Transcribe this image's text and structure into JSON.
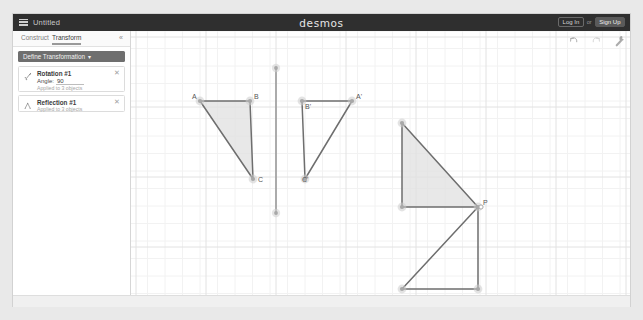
{
  "window": {
    "title": "Untitled",
    "brand": "desmos",
    "menu_icon": "hamburger-menu-icon"
  },
  "account": {
    "login_label": "Log In",
    "separator": "or",
    "signup_label": "Sign Up"
  },
  "panel": {
    "tabs": [
      {
        "label": "Construct",
        "active": false
      },
      {
        "label": "Transform",
        "active": true
      }
    ],
    "collapse_icon": "«",
    "define_button": {
      "label": "Define Transformation",
      "caret": "▾"
    },
    "cards": [
      {
        "icon": "rotation-icon",
        "title": "Rotation #1",
        "angle_label": "Angle:",
        "angle_value": "90",
        "subtitle": "Applied to 3 objects",
        "close_icon": "✕"
      },
      {
        "icon": "reflection-icon",
        "title": "Reflection #1",
        "subtitle": "Applied to 3 objects",
        "close_icon": "✕"
      }
    ]
  },
  "canvas": {
    "tools": [
      {
        "name": "undo-icon",
        "label": "Undo"
      },
      {
        "name": "redo-icon",
        "label": "Redo"
      },
      {
        "name": "wrench-icon",
        "label": "Settings"
      }
    ],
    "grid": {
      "minor_spacing": 17.5,
      "major_spacing": 70,
      "minor_color": "#f2f2f2",
      "major_color": "#e2e2e2"
    },
    "colors": {
      "stroke": "#6e6e6e",
      "fill": "#e0e0e0",
      "point": "#a8a8a8",
      "label": "#555555",
      "mirror_line": "#9a9a9a"
    },
    "point_labels": [
      {
        "text": "A",
        "x": 62,
        "y": 68
      },
      {
        "text": "B",
        "x": 124,
        "y": 68
      },
      {
        "text": "C",
        "x": 128,
        "y": 151
      },
      {
        "text": "B'",
        "x": 175,
        "y": 78
      },
      {
        "text": "A'",
        "x": 226,
        "y": 68
      },
      {
        "text": "C'",
        "x": 172,
        "y": 151
      },
      {
        "text": "P",
        "x": 353,
        "y": 174
      }
    ],
    "shapes": {
      "triangle_abc": {
        "name": "Triangle ABC",
        "filled": true,
        "points": [
          [
            70,
            70
          ],
          [
            120,
            70
          ],
          [
            123,
            148
          ]
        ]
      },
      "triangle_abc_prime": {
        "name": "Triangle A'B'C' (reflection)",
        "filled": false,
        "points": [
          [
            172,
            70
          ],
          [
            222,
            70
          ],
          [
            175,
            148
          ]
        ]
      },
      "mirror_line": {
        "name": "Reflection line",
        "from": [
          146,
          37
        ],
        "to": [
          146,
          182
        ]
      },
      "triangle_upper_right": {
        "name": "Shaded triangle at P",
        "filled": true,
        "points": [
          [
            272,
            92
          ],
          [
            272,
            176
          ],
          [
            348,
            176
          ]
        ]
      },
      "triangle_lower_right": {
        "name": "Rotated triangle at P",
        "filled": false,
        "points": [
          [
            348,
            176
          ],
          [
            348,
            258
          ],
          [
            272,
            258
          ]
        ]
      }
    }
  }
}
